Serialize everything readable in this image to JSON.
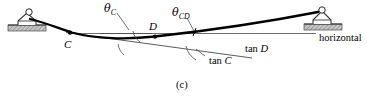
{
  "figure": {
    "caption": "(c)",
    "colors": {
      "ink": "#000000",
      "thin_line": "#555555",
      "hatch_fill": "#9a9a9a",
      "background": "#ffffff"
    },
    "labels": {
      "theta_c": {
        "symbol": "θ",
        "subscript": "C"
      },
      "theta_cd": {
        "symbol": "θ",
        "subscript": "CD"
      },
      "point_c": "C",
      "point_d": "D",
      "horizontal": "horizontal",
      "tan_d": "tan D",
      "tan_c": "tan C"
    },
    "supports": [
      {
        "name": "left-pin-support",
        "x": 25,
        "y": 22
      },
      {
        "name": "right-pin-support",
        "x": 321,
        "y": 20
      }
    ],
    "points": [
      {
        "label": "C",
        "x": 70,
        "y": 33
      },
      {
        "label": "D",
        "x": 155,
        "y": 36
      }
    ],
    "deflection_curve": "M 30 20 C 48 25, 60 30, 78 34 C 100 39, 130 38, 155 36 C 200 31, 270 22, 318 14",
    "horizontal_reference_line": {
      "x1": 68,
      "y1": 33,
      "x2": 316,
      "y2": 33
    },
    "tangent_at_c": {
      "x1": 68,
      "y1": 33,
      "x2": 250,
      "y2": 58
    },
    "tangent_at_d_segment": {
      "x1": 100,
      "y1": 33,
      "x2": 150,
      "y2": 33
    },
    "angle_arcs": [
      {
        "name": "arc-theta-c-at-d",
        "cx": 155,
        "cy": 36
      },
      {
        "name": "arc-theta-c-lower",
        "cx": 120,
        "cy": 38
      },
      {
        "name": "arc-theta-cd",
        "cx": 215,
        "cy": 30
      }
    ],
    "leader_lines": [
      {
        "name": "leader-theta-c",
        "x1": 118,
        "y1": 14,
        "x2": 128,
        "y2": 30
      },
      {
        "name": "leader-theta-cd",
        "x1": 188,
        "y1": 18,
        "x2": 194,
        "y2": 33
      },
      {
        "name": "leader-tan-c",
        "x1": 224,
        "y1": 54,
        "x2": 212,
        "y2": 48
      }
    ]
  }
}
